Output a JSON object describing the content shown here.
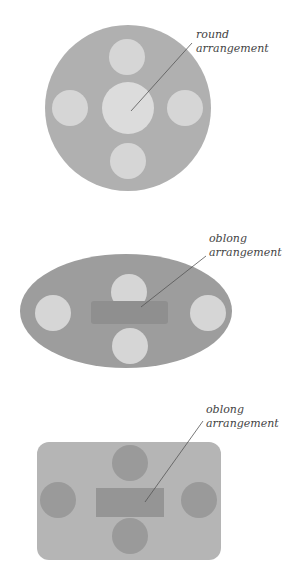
{
  "figures": [
    {
      "id": "round",
      "label_line1": "round",
      "label_line2": "arrangement",
      "shape": "circle",
      "table_color": "#b0b0b0",
      "chair_color": "#d8d8d8",
      "center_color": "#dedede"
    },
    {
      "id": "oval",
      "label_line1": "oblong",
      "label_line2": "arrangement",
      "shape": "ellipse",
      "table_color": "#9d9d9d",
      "chair_color": "#d6d6d6",
      "center_color": "#8f8f8f"
    },
    {
      "id": "rect",
      "label_line1": "oblong",
      "label_line2": "arrangement",
      "shape": "rounded-rectangle",
      "table_color": "#b5b5b5",
      "chair_color": "#9a9a9a",
      "center_color": "#959595"
    }
  ]
}
